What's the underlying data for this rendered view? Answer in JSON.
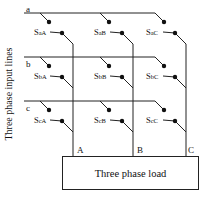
{
  "diagram": {
    "title_vertical": "Three phase input lines",
    "input_lines": [
      {
        "id": "a",
        "label": "a"
      },
      {
        "id": "b",
        "label": "b"
      },
      {
        "id": "c",
        "label": "c"
      }
    ],
    "output_phases": [
      {
        "id": "A",
        "label": "A"
      },
      {
        "id": "B",
        "label": "B"
      },
      {
        "id": "C",
        "label": "C"
      }
    ],
    "switches": [
      {
        "row": "a",
        "col": "A",
        "prefix": "S",
        "sub": "aA"
      },
      {
        "row": "a",
        "col": "B",
        "prefix": "S",
        "sub": "aB"
      },
      {
        "row": "a",
        "col": "C",
        "prefix": "S",
        "sub": "aC"
      },
      {
        "row": "b",
        "col": "A",
        "prefix": "S",
        "sub": "bA"
      },
      {
        "row": "b",
        "col": "B",
        "prefix": "S",
        "sub": "bB"
      },
      {
        "row": "b",
        "col": "C",
        "prefix": "S",
        "sub": "bC"
      },
      {
        "row": "c",
        "col": "A",
        "prefix": "S",
        "sub": "cA"
      },
      {
        "row": "c",
        "col": "B",
        "prefix": "S",
        "sub": "cB"
      },
      {
        "row": "c",
        "col": "C",
        "prefix": "S",
        "sub": "cC"
      }
    ],
    "load_label": "Three phase load",
    "line_color": "#222222"
  }
}
